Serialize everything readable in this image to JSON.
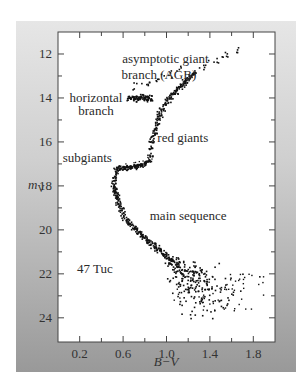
{
  "chart_data": {
    "type": "scatter",
    "title": "",
    "subtitle": "47 Tuc",
    "xlabel": "B−V",
    "ylabel": "m_V",
    "ylabel_main": "m",
    "ylabel_sub": "V",
    "xlim": [
      0.0,
      2.0
    ],
    "ylim": [
      25.1,
      11.0
    ],
    "y_inverted": true,
    "grid": false,
    "legend": "none",
    "x_ticks": [
      0.2,
      0.6,
      1.0,
      1.4,
      1.8
    ],
    "x_tick_labels": [
      "0.2",
      "0.6",
      "1.0",
      "1.4",
      "1.8"
    ],
    "x_minor_ticks": [
      0.4,
      0.8,
      1.2,
      1.6
    ],
    "y_ticks": [
      12,
      14,
      16,
      18,
      20,
      22,
      24
    ],
    "y_tick_labels": [
      "12",
      "14",
      "16",
      "18",
      "20",
      "22",
      "24"
    ],
    "y_minor_ticks": [
      13,
      15,
      17,
      19,
      21,
      23
    ],
    "annotations": [
      {
        "text": "asymptotic giant",
        "x": 0.99,
        "y": 12.25,
        "anchor": "middle"
      },
      {
        "text": "branch (AGB)",
        "x": 0.93,
        "y": 12.95,
        "anchor": "middle"
      },
      {
        "text": "horizontal",
        "x": 0.35,
        "y": 14.0,
        "anchor": "middle"
      },
      {
        "text": "branch",
        "x": 0.35,
        "y": 14.6,
        "anchor": "middle"
      },
      {
        "text": "red giants",
        "x": 1.15,
        "y": 15.8,
        "anchor": "middle"
      },
      {
        "text": "subgiants",
        "x": 0.27,
        "y": 16.75,
        "anchor": "middle"
      },
      {
        "text": "main sequence",
        "x": 1.2,
        "y": 19.35,
        "anchor": "middle"
      },
      {
        "text": "47 Tuc",
        "x": 0.34,
        "y": 21.8,
        "anchor": "middle"
      }
    ],
    "series": [
      {
        "name": "main sequence",
        "x": [
          0.55,
          0.56,
          0.57,
          0.58,
          0.6,
          0.62,
          0.64,
          0.66,
          0.68,
          0.7,
          0.72,
          0.74,
          0.76,
          0.78,
          0.8,
          0.82,
          0.84,
          0.86,
          0.88,
          0.9,
          0.92,
          0.94,
          0.96,
          0.98,
          1.0,
          1.02,
          1.04,
          1.06,
          1.08,
          1.1,
          1.12,
          1.14,
          1.16,
          1.18,
          1.2,
          1.22,
          1.24,
          1.26,
          1.28,
          1.3,
          1.32,
          1.34,
          1.36,
          1.38,
          1.4
        ],
        "y": [
          18.6,
          18.8,
          18.95,
          19.1,
          19.3,
          19.45,
          19.6,
          19.7,
          19.8,
          19.9,
          20.0,
          20.1,
          20.2,
          20.3,
          20.35,
          20.45,
          20.55,
          20.6,
          20.7,
          20.8,
          20.85,
          20.95,
          21.05,
          21.1,
          21.2,
          21.3,
          21.35,
          21.45,
          21.55,
          21.6,
          21.7,
          21.8,
          21.85,
          21.95,
          22.05,
          22.1,
          22.2,
          22.3,
          22.4,
          22.5,
          22.6,
          22.7,
          22.8,
          22.9,
          23.0
        ]
      },
      {
        "name": "turnoff",
        "x": [
          0.54,
          0.53,
          0.52,
          0.52,
          0.52,
          0.53,
          0.53,
          0.54,
          0.55
        ],
        "y": [
          17.4,
          17.6,
          17.8,
          18.0,
          18.1,
          18.2,
          18.3,
          18.4,
          18.5
        ]
      },
      {
        "name": "subgiants",
        "x": [
          0.54,
          0.56,
          0.58,
          0.6,
          0.62,
          0.64,
          0.66,
          0.68,
          0.7,
          0.72,
          0.74,
          0.76,
          0.78,
          0.8,
          0.82,
          0.84
        ],
        "y": [
          17.25,
          17.22,
          17.2,
          17.2,
          17.18,
          17.17,
          17.16,
          17.15,
          17.14,
          17.12,
          17.1,
          17.08,
          17.05,
          17.0,
          16.95,
          16.85
        ]
      },
      {
        "name": "red giants",
        "x": [
          0.85,
          0.86,
          0.87,
          0.88,
          0.89,
          0.9,
          0.91,
          0.92,
          0.93,
          0.94,
          0.96,
          0.98,
          1.0,
          1.02,
          1.04,
          1.06,
          1.08,
          1.1,
          1.12,
          1.14,
          1.16,
          1.18,
          1.2,
          1.22,
          1.24,
          1.26
        ],
        "y": [
          16.6,
          16.3,
          16.0,
          15.8,
          15.6,
          15.4,
          15.2,
          15.0,
          14.85,
          14.7,
          14.5,
          14.35,
          14.2,
          14.05,
          13.95,
          13.85,
          13.75,
          13.65,
          13.55,
          13.45,
          13.35,
          13.25,
          13.15,
          13.05,
          12.95,
          12.85
        ]
      },
      {
        "name": "red giant tip",
        "x": [
          1.3,
          1.34,
          1.38,
          1.42,
          1.46,
          1.5,
          1.54,
          1.58,
          1.62,
          1.66
        ],
        "y": [
          12.65,
          12.55,
          12.45,
          12.35,
          12.25,
          12.15,
          12.05,
          11.95,
          11.9,
          11.8
        ]
      },
      {
        "name": "horizontal branch",
        "x": [
          0.72,
          0.74,
          0.76,
          0.78,
          0.8,
          0.82,
          0.84,
          0.86,
          0.7,
          0.68,
          0.66
        ],
        "y": [
          14.05,
          14.0,
          14.02,
          13.98,
          14.05,
          14.0,
          14.03,
          14.0,
          13.98,
          14.02,
          14.05
        ]
      },
      {
        "name": "AGB",
        "x": [
          0.7,
          0.74,
          0.78,
          0.82,
          0.86,
          0.9,
          0.94,
          0.98,
          1.02,
          1.06,
          1.1,
          1.14
        ],
        "y": [
          13.45,
          13.35,
          13.35,
          13.3,
          13.3,
          13.2,
          13.1,
          13.0,
          12.95,
          12.85,
          12.75,
          12.65
        ]
      }
    ]
  },
  "style": {
    "point_color": "#111111",
    "plot_bg": "#ffffff",
    "axis_color": "#444444"
  }
}
